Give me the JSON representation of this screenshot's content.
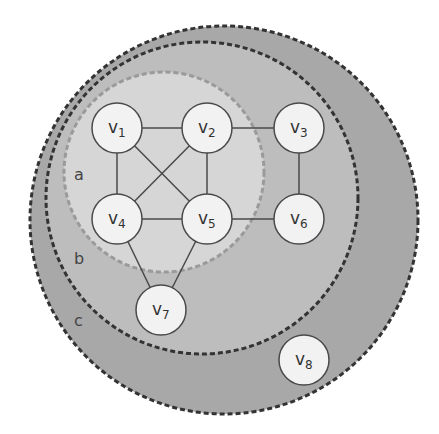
{
  "colors": {
    "background": "#ffffff",
    "region_c_fill": "#a8a8a8",
    "region_b_fill": "#bdbdbd",
    "region_a_fill": "#d6d6d6",
    "node_fill": "#f2f2f2",
    "stroke": "#4a4a4a",
    "dash_outer": "#333333",
    "dash_a": "#9a9a9a"
  },
  "regions": [
    {
      "id": "c",
      "label": "c",
      "cx": 224,
      "cy": 220,
      "r": 194,
      "label_x": 74,
      "label_y": 326
    },
    {
      "id": "b",
      "label": "b",
      "cx": 202,
      "cy": 198,
      "r": 156,
      "label_x": 74,
      "label_y": 264
    },
    {
      "id": "a",
      "label": "a",
      "cx": 164,
      "cy": 172,
      "r": 100,
      "label_x": 74,
      "label_y": 180
    }
  ],
  "nodes": [
    {
      "id": "v1",
      "label": "v",
      "sub": "1",
      "cx": 117,
      "cy": 128
    },
    {
      "id": "v2",
      "label": "v",
      "sub": "2",
      "cx": 207,
      "cy": 128
    },
    {
      "id": "v3",
      "label": "v",
      "sub": "3",
      "cx": 299,
      "cy": 128
    },
    {
      "id": "v4",
      "label": "v",
      "sub": "4",
      "cx": 117,
      "cy": 219
    },
    {
      "id": "v5",
      "label": "v",
      "sub": "5",
      "cx": 207,
      "cy": 219
    },
    {
      "id": "v6",
      "label": "v",
      "sub": "6",
      "cx": 299,
      "cy": 219
    },
    {
      "id": "v7",
      "label": "v",
      "sub": "7",
      "cx": 161,
      "cy": 310
    },
    {
      "id": "v8",
      "label": "v",
      "sub": "8",
      "cx": 304,
      "cy": 360
    }
  ],
  "node_radius": 25,
  "edges": [
    [
      "v1",
      "v2"
    ],
    [
      "v2",
      "v3"
    ],
    [
      "v1",
      "v4"
    ],
    [
      "v1",
      "v5"
    ],
    [
      "v2",
      "v4"
    ],
    [
      "v2",
      "v5"
    ],
    [
      "v3",
      "v6"
    ],
    [
      "v4",
      "v5"
    ],
    [
      "v5",
      "v6"
    ],
    [
      "v4",
      "v7"
    ],
    [
      "v5",
      "v7"
    ]
  ]
}
